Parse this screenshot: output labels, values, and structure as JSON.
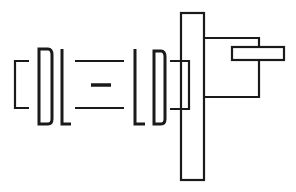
{
  "diagram": {
    "colors": {
      "stroke": "#1a1a1a",
      "background": "#ffffff"
    },
    "components": [
      {
        "id": "left-bracket",
        "shape": "bracket"
      },
      {
        "id": "letter-D-left",
        "shape": "D-shape"
      },
      {
        "id": "letter-L-left",
        "shape": "L-shape"
      },
      {
        "id": "equals-top-line",
        "shape": "line"
      },
      {
        "id": "center-dash",
        "shape": "line"
      },
      {
        "id": "equals-bottom-line",
        "shape": "line"
      },
      {
        "id": "letter-L-right",
        "shape": "L-shape"
      },
      {
        "id": "letter-D-right",
        "shape": "reversed D-shape"
      },
      {
        "id": "connector-block",
        "shape": "open rectangle"
      },
      {
        "id": "vertical-plate",
        "shape": "rectangle"
      },
      {
        "id": "arm-frame",
        "shape": "open rectangle"
      },
      {
        "id": "horizontal-bar",
        "shape": "rectangle"
      }
    ]
  }
}
